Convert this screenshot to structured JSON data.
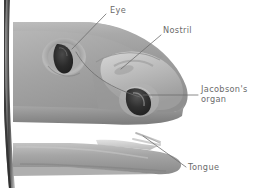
{
  "figure": {
    "name": "snake-head-anatomy",
    "medium": "grayscale-illustration",
    "background_color": "#ffffff",
    "scan_artifact": "dark book-binding shadow along left edge",
    "width": 262,
    "height": 188
  },
  "labels": [
    {
      "id": "eye",
      "text": "Eye",
      "lines": [
        "Eye"
      ],
      "x": 110,
      "y": 6,
      "color": "#6b6b6b"
    },
    {
      "id": "nostril",
      "text": "Nostril",
      "lines": [
        "Nostril"
      ],
      "x": 163,
      "y": 26,
      "color": "#6b6b6b"
    },
    {
      "id": "jacobsons",
      "text": "Jacobson's organ",
      "lines": [
        "Jacobson's",
        "organ"
      ],
      "x": 201,
      "y": 85,
      "color": "#6b6b6b"
    },
    {
      "id": "tongue",
      "text": "Tongue",
      "lines": [
        "Tongue"
      ],
      "x": 188,
      "y": 163,
      "color": "#6b6b6b"
    }
  ],
  "leader_lines": [
    {
      "id": "leader-eye",
      "from": [
        106,
        14
      ],
      "to": [
        72,
        49
      ],
      "style": "straight"
    },
    {
      "id": "leader-nostril",
      "from": [
        161,
        35
      ],
      "to": [
        121,
        69
      ],
      "style": "straight"
    },
    {
      "id": "leader-jacobsons",
      "from": [
        197,
        95
      ],
      "to": [
        143,
        95
      ],
      "style": "straight"
    },
    {
      "id": "leader-tongue",
      "from": [
        186,
        167
      ],
      "to": [
        143,
        136
      ],
      "style": "straight"
    },
    {
      "id": "pointer-curve-jacobsons",
      "from": [
        76,
        52
      ],
      "to": [
        140,
        97
      ],
      "style": "curved"
    }
  ],
  "anatomy_parts": [
    {
      "id": "head",
      "label": "Snake head",
      "shading": "gray gradient"
    },
    {
      "id": "eye-opening",
      "label": "Eye",
      "shading": "dark almond with raised rim"
    },
    {
      "id": "nostril-opening",
      "label": "Nostril",
      "shading": "shallow crease on snout"
    },
    {
      "id": "jacobsons-organ",
      "label": "Jacobson's organ",
      "shading": "dark teardrop cavity in roof of mouth"
    },
    {
      "id": "upper-jaw",
      "label": "Upper jaw",
      "shading": "mid gray"
    },
    {
      "id": "lower-jaw",
      "label": "Lower jaw",
      "shading": "mid gray"
    },
    {
      "id": "mouth-cavity",
      "label": "Open mouth",
      "shading": "white"
    },
    {
      "id": "tongue",
      "label": "Forked tongue",
      "shading": "light gray fork"
    }
  ],
  "palette": {
    "background": "#ffffff",
    "label_text": "#6b6b6b",
    "leader_line": "#6d6d6d",
    "body_light": "#d2d2d2",
    "body_mid": "#a8a8a8",
    "body_dark": "#8a8a8a",
    "shadow": "#6f6f6f",
    "opening_dark": "#2e2e2e",
    "binding_shadow": "#3a3a3a"
  }
}
